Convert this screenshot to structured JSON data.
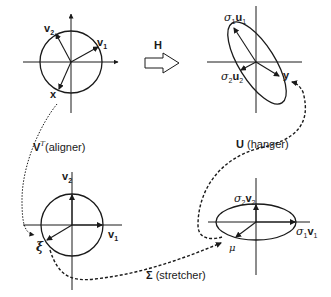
{
  "diagram": {
    "transform": {
      "label": "H",
      "arrow": "hollow-right-arrow"
    },
    "panels": {
      "top_left": {
        "shape": "unit-circle",
        "vectors": {
          "v2": "v",
          "v2_sub": "2",
          "v1": "v",
          "v1_sub": "1",
          "x": "x"
        }
      },
      "top_right": {
        "shape": "tilted-ellipse",
        "vectors": {
          "s1u1_sigma": "σ",
          "s1u1_sigma_sub": "1",
          "s1u1_vec": "u",
          "s1u1_sub": "1",
          "s2u2_sigma": "σ",
          "s2u2_sigma_sub": "2",
          "s2u2_vec": "u",
          "s2u2_sub": "2",
          "y": "y"
        }
      },
      "bottom_left": {
        "shape": "unit-circle",
        "vectors": {
          "v2": "v",
          "v2_sub": "2",
          "v1": "v",
          "v1_sub": "1",
          "xi": "ξ"
        }
      },
      "bottom_right": {
        "shape": "axis-aligned-ellipse",
        "vectors": {
          "s2v2_sigma": "σ",
          "s2v2_sigma_sub": "2",
          "s2v2_vec": "v",
          "s2v2_sub": "2",
          "s1v1_sigma": "σ",
          "s1v1_sigma_sub": "1",
          "s1v1_vec": "v",
          "s1v1_sub": "1",
          "mu": "μ"
        }
      }
    },
    "paths": {
      "aligner": {
        "symbol": "V",
        "sup": "T",
        "text": "(aligner)",
        "style": "dotted"
      },
      "stretcher": {
        "symbol": "Σ",
        "text": " (stretcher)",
        "style": "dashed"
      },
      "hanger": {
        "symbol": "U",
        "text": " (hanger)",
        "style": "dashed"
      }
    },
    "colors": {
      "stroke": "#1a1a1a",
      "background": "#ffffff"
    }
  }
}
